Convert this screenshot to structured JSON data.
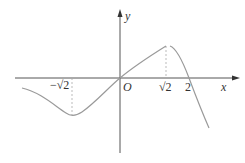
{
  "diagram": {
    "type": "function-graph",
    "axes": {
      "x_label": "x",
      "y_label": "y",
      "origin_label": "O"
    },
    "ticks": {
      "neg_sqrt2": "−√2",
      "sqrt2": "√2",
      "two": "2"
    },
    "colors": {
      "axis": "#444444",
      "curve": "#9a9a9a",
      "dashed": "#aaaaaa",
      "text": "#333333"
    },
    "features": [
      {
        "name": "local-minimum",
        "x": "−√2"
      },
      {
        "name": "local-maximum",
        "x": "√2"
      },
      {
        "name": "x-intercept",
        "x": "0"
      },
      {
        "name": "x-intercept",
        "x": "2"
      }
    ]
  }
}
